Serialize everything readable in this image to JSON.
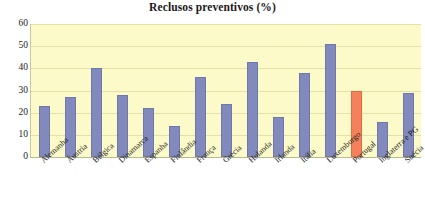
{
  "chart_data": {
    "type": "bar",
    "title": "Reclusos preventivos (%)",
    "xlabel": "",
    "ylabel": "",
    "ylim": [
      0,
      60
    ],
    "yticks": [
      0,
      10,
      20,
      30,
      40,
      50,
      60
    ],
    "grid": true,
    "legend": "none",
    "categories": [
      "Alemanha",
      "Áustria",
      "Bélgica",
      "Dinamarca",
      "Espanha",
      "Finlândia",
      "França",
      "Grécia",
      "Holanda",
      "Irlanda",
      "Itália",
      "Luxemburgo",
      "Portugal",
      "Inglaterra e PG",
      "Suécia"
    ],
    "values": [
      23,
      27,
      40,
      28,
      22,
      14,
      36,
      24,
      43,
      18,
      38,
      51,
      30,
      16,
      29
    ],
    "highlight_category": "Portugal",
    "colors": {
      "bar": "#8189bd",
      "bar_border": "#6f78ae",
      "highlight_bar": "#f4815c",
      "highlight_border": "#e06a45",
      "plot_background": "#fcfac8",
      "gridline": "#e3e0a8",
      "axis": "#b9b98f",
      "text": "#1c1c1c",
      "page_background": "#ffffff"
    }
  }
}
